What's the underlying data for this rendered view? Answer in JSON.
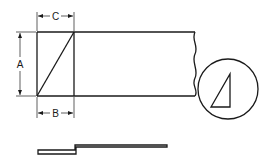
{
  "diagram": {
    "labels": {
      "dim_a": "A",
      "dim_b": "B",
      "dim_c": "C"
    },
    "colors": {
      "line": "#1a1a1a",
      "background": "#ffffff"
    }
  }
}
